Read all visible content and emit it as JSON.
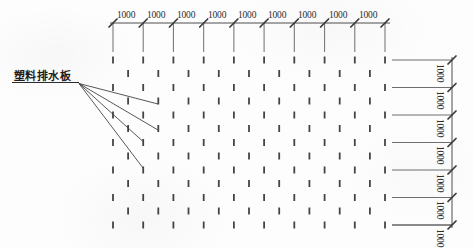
{
  "drawing": {
    "title": "塑料排水板平面布置图",
    "callout_label": "塑料排水板",
    "line_color": "#3a3a3a",
    "text_color": "#2b2b2b",
    "background_color": "#fdfdfd"
  },
  "top_dimension_chain": {
    "orientation": "horizontal",
    "tick_style": "slash",
    "segment_count": 9,
    "labels": [
      "1000",
      "1000",
      "1000",
      "1000",
      "1000",
      "1000",
      "1000",
      "1000",
      "1000"
    ],
    "extension_line_x": [
      113,
      143.2,
      173.4,
      203.7,
      233.9,
      264.1,
      294.3,
      324.6,
      354.8,
      385
    ],
    "dimension_line_y": 23,
    "extension_line_bottom_y": 52,
    "label_y": 11
  },
  "right_dimension_chain": {
    "orientation": "vertical",
    "tick_style": "slash",
    "segment_count": 7,
    "labels": [
      "1000",
      "1000",
      "1000",
      "1000",
      "1000",
      "1000",
      "1000"
    ],
    "extension_line_y": [
      60,
      87.5,
      115,
      142.5,
      170,
      197.5,
      225
    ],
    "dimension_line_x": 452,
    "extension_line_left_x": 392,
    "label_x": 444
  },
  "drain_grid": {
    "mark_shape": "short-vertical-dash",
    "mark_width": 1.8,
    "mark_height": 7,
    "mark_color": "#444444",
    "aligned_row_y": [
      60,
      87.5,
      115,
      142.5,
      170,
      197.5,
      225
    ],
    "aligned_row_mark_count": 10,
    "offset_row_y": [
      73.5,
      101,
      128.5,
      156,
      183.5,
      211
    ],
    "offset_row_mark_count": 9,
    "column_x_start": 113,
    "column_spacing": 30.22,
    "offset_shift": 15.11
  },
  "callout": {
    "label": "塑料排水板",
    "underline_from_x": 12,
    "underline_to_x": 79,
    "underline_y": 82.5,
    "leader_origin_x": 79,
    "leader_origin_y": 83.5,
    "leader_targets": [
      {
        "x": 158,
        "y": 104
      },
      {
        "x": 158,
        "y": 130
      },
      {
        "x": 143,
        "y": 141.5
      },
      {
        "x": 143,
        "y": 168
      }
    ]
  }
}
